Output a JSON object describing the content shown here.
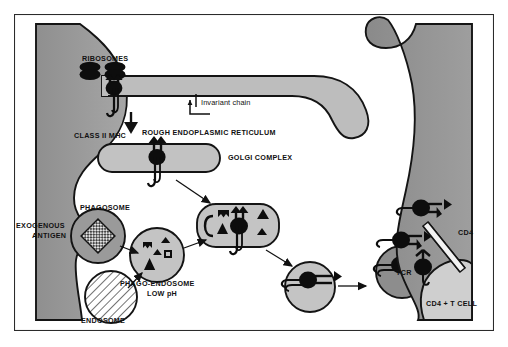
{
  "figure": {
    "background_color": "#ffffff",
    "border_color": "#2b2b2b"
  },
  "palette": {
    "cell_cytoplasm_gray": "#9a9a9a",
    "cell_dark_gray": "#8d8d8d",
    "vesicle_light_gray": "#c4c4c4",
    "er_lumen_gray": "#bdbdbd",
    "golgi_gray": "#c0c0c0",
    "tcell_light_gray": "#cfcfcf",
    "outline_black": "#141414",
    "white": "#ffffff",
    "antigen_fill": "#dcdcdc"
  },
  "labels": [
    {
      "id": "ribosomes",
      "text": "RIBOSOMES",
      "x": 68,
      "y": 47,
      "style": "bold",
      "align": "left"
    },
    {
      "id": "invariant",
      "text": "Invariant chain",
      "x": 186,
      "y": 91,
      "style": "light",
      "align": "left"
    },
    {
      "id": "class2mhc",
      "text": "CLASS II MHC",
      "x": 63,
      "y": 124,
      "style": "bold",
      "align": "left"
    },
    {
      "id": "rer",
      "text": "ROUGH ENDOPLASMIC RETICULUM",
      "x": 170,
      "y": 121,
      "style": "bold",
      "align": "left"
    },
    {
      "id": "golgi",
      "text": "GOLGI COMPLEX",
      "x": 216,
      "y": 151,
      "style": "bold",
      "align": "left"
    },
    {
      "id": "phagosome",
      "text": "PHAGOSOME",
      "x": 74,
      "y": 199,
      "style": "bold",
      "align": "left"
    },
    {
      "id": "exogenous1",
      "text": "EXOGENOUS",
      "x": 8,
      "y": 216,
      "style": "bold",
      "align": "left"
    },
    {
      "id": "exogenous2",
      "text": "ANTIGEN",
      "x": 19,
      "y": 226,
      "style": "bold",
      "align": "left"
    },
    {
      "id": "phagoendo1",
      "text": "PHAGO-ENDOSOME",
      "x": 120,
      "y": 272,
      "style": "bold",
      "align": "left"
    },
    {
      "id": "phagoendo2",
      "text": "LOW pH",
      "x": 146,
      "y": 282,
      "style": "bold",
      "align": "left"
    },
    {
      "id": "endosome",
      "text": "ENDOSOME",
      "x": 69,
      "y": 313,
      "style": "bold",
      "align": "left"
    },
    {
      "id": "cd4",
      "text": "CD4",
      "x": 457,
      "y": 227,
      "style": "bold",
      "align": "left"
    },
    {
      "id": "tcr",
      "text": "TCR",
      "x": 410,
      "y": 265,
      "style": "bold",
      "align": "left"
    },
    {
      "id": "cd4tcell",
      "text": "CD4 + T CELL",
      "x": 428,
      "y": 298,
      "style": "bold",
      "align": "left"
    }
  ],
  "structures": {
    "antigen_presenting_cell": "Antigen presenting cell (left, gray cytoplasm)",
    "rough_er": "Rough endoplasmic reticulum with bound ribosomes",
    "golgi_complex": "Golgi complex (capsule shaped cisterna)",
    "phagosome": "Phagosome containing exogenous antigen",
    "endosome": "Endosome (hatched circle)",
    "phago_endosome": "Phago-endosome, low pH, containing peptide fragments",
    "miic": "MHC class II loading compartment (capsule) with peptides",
    "transport_vesicle": "Transport vesicle carrying peptide-MHC complex",
    "t_cell": "CD4 + T cell (right, gray) bearing TCR and CD4"
  },
  "symbols": {
    "ribosome": "ribosome-pair",
    "mhc_class_ii": "class-ii-mhc-molecule",
    "invariant_chain": "invariant-chain-tail",
    "peptide_fragments": [
      "triangle",
      "square",
      "pentagon",
      "notched-block"
    ],
    "antigen": "cross-hatched-diamond",
    "cd4_molecule": "cd4-rod",
    "tcr_molecule": "tcr-y"
  },
  "arrows": [
    {
      "id": "er-to-golgi",
      "from": "rough-er",
      "to": "golgi-complex"
    },
    {
      "id": "golgi-to-miic",
      "from": "golgi-complex",
      "to": "miic-compartment"
    },
    {
      "id": "antigen-to-phagosome",
      "from": "exogenous-antigen",
      "to": "phagosome"
    },
    {
      "id": "endosome-to-phago",
      "from": "endosome",
      "to": "phago-endosome"
    },
    {
      "id": "phagosome-to-phago",
      "from": "phagosome",
      "to": "phago-endosome"
    },
    {
      "id": "phago-to-miic",
      "from": "phago-endosome",
      "to": "miic-compartment"
    },
    {
      "id": "miic-to-vesicle",
      "from": "miic-compartment",
      "to": "transport-vesicle"
    },
    {
      "id": "vesicle-to-surface",
      "from": "transport-vesicle",
      "to": "cell-surface"
    }
  ]
}
